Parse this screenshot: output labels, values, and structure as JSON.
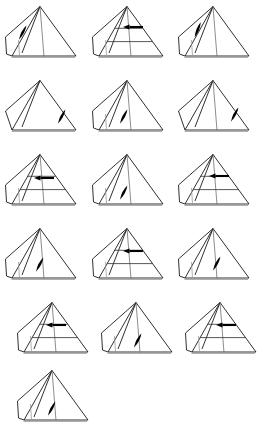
{
  "page": {
    "background_color": "#ffffff",
    "width": 269,
    "height": 432,
    "line_color": "#1a1a1a",
    "faint_line_color": "#9a9a9a",
    "arrow_color": "#000000",
    "figure_count": 16,
    "columns": 3,
    "rows": 6
  },
  "figures": [
    {
      "id": "figure-1",
      "row": 1,
      "col": 1,
      "x": 4,
      "y": 4,
      "w": 80,
      "h": 64,
      "arrow_type": "diagonal",
      "arrow_direction": "down-left",
      "arrow_x": 19,
      "arrow_y": 28,
      "arrow_angle": 62,
      "arrow_length": 16,
      "cross_sections": 0,
      "ridge_lines": 2,
      "left_panel": true,
      "label": "pyramid-diagonal-arrow-upper-left"
    },
    {
      "id": "figure-2",
      "row": 1,
      "col": 2,
      "x": 91,
      "y": 4,
      "w": 80,
      "h": 64,
      "arrow_type": "horizontal",
      "arrow_direction": "left",
      "arrow_x": 52,
      "arrow_y": 23,
      "arrow_angle": 180,
      "arrow_length": 20,
      "cross_sections": 2,
      "ridge_lines": 2,
      "left_panel": true,
      "label": "pyramid-horizontal-arrow-with-sections"
    },
    {
      "id": "figure-3",
      "row": 1,
      "col": 3,
      "x": 177,
      "y": 4,
      "w": 80,
      "h": 64,
      "arrow_type": "diagonal",
      "arrow_direction": "down-left",
      "arrow_x": 21,
      "arrow_y": 25,
      "arrow_angle": 68,
      "arrow_length": 16,
      "cross_sections": 0,
      "ridge_lines": 2,
      "left_panel": true,
      "label": "pyramid-diagonal-arrow-upper-left"
    },
    {
      "id": "figure-4",
      "row": 2,
      "col": 1,
      "x": 4,
      "y": 78,
      "w": 80,
      "h": 64,
      "arrow_type": "diagonal",
      "arrow_direction": "down-left",
      "arrow_x": 58,
      "arrow_y": 38,
      "arrow_angle": 62,
      "arrow_length": 16,
      "cross_sections": 0,
      "ridge_lines": 1,
      "left_panel": false,
      "label": "pyramid-diagonal-arrow-right-face"
    },
    {
      "id": "figure-5",
      "row": 2,
      "col": 2,
      "x": 91,
      "y": 78,
      "w": 80,
      "h": 64,
      "arrow_type": "diagonal",
      "arrow_direction": "down-left",
      "arrow_x": 33,
      "arrow_y": 38,
      "arrow_angle": 62,
      "arrow_length": 16,
      "cross_sections": 0,
      "ridge_lines": 2,
      "left_panel": true,
      "label": "pyramid-diagonal-arrow-center"
    },
    {
      "id": "figure-6",
      "row": 2,
      "col": 3,
      "x": 177,
      "y": 78,
      "w": 80,
      "h": 64,
      "arrow_type": "diagonal",
      "arrow_direction": "down-left",
      "arrow_x": 58,
      "arrow_y": 36,
      "arrow_angle": 62,
      "arrow_length": 16,
      "cross_sections": 0,
      "ridge_lines": 2,
      "left_panel": false,
      "label": "pyramid-diagonal-arrow-right-face"
    },
    {
      "id": "figure-7",
      "row": 3,
      "col": 1,
      "x": 4,
      "y": 152,
      "w": 80,
      "h": 64,
      "arrow_type": "horizontal",
      "arrow_direction": "left",
      "arrow_x": 50,
      "arrow_y": 26,
      "arrow_angle": 180,
      "arrow_length": 20,
      "cross_sections": 2,
      "ridge_lines": 2,
      "left_panel": true,
      "label": "pyramid-horizontal-arrow-with-sections"
    },
    {
      "id": "figure-8",
      "row": 3,
      "col": 2,
      "x": 91,
      "y": 152,
      "w": 80,
      "h": 64,
      "arrow_type": "diagonal",
      "arrow_direction": "down-left",
      "arrow_x": 33,
      "arrow_y": 40,
      "arrow_angle": 62,
      "arrow_length": 16,
      "cross_sections": 0,
      "ridge_lines": 2,
      "left_panel": true,
      "label": "pyramid-diagonal-arrow-center"
    },
    {
      "id": "figure-9",
      "row": 3,
      "col": 3,
      "x": 177,
      "y": 152,
      "w": 80,
      "h": 64,
      "arrow_type": "horizontal",
      "arrow_direction": "left",
      "arrow_x": 52,
      "arrow_y": 24,
      "arrow_angle": 180,
      "arrow_length": 20,
      "cross_sections": 2,
      "ridge_lines": 2,
      "left_panel": true,
      "label": "pyramid-horizontal-arrow-with-sections"
    },
    {
      "id": "figure-10",
      "row": 4,
      "col": 1,
      "x": 4,
      "y": 226,
      "w": 80,
      "h": 64,
      "arrow_type": "diagonal",
      "arrow_direction": "down-left",
      "arrow_x": 36,
      "arrow_y": 38,
      "arrow_angle": 62,
      "arrow_length": 16,
      "cross_sections": 0,
      "ridge_lines": 2,
      "left_panel": true,
      "label": "pyramid-diagonal-arrow-center"
    },
    {
      "id": "figure-11",
      "row": 4,
      "col": 2,
      "x": 91,
      "y": 226,
      "w": 80,
      "h": 64,
      "arrow_type": "horizontal",
      "arrow_direction": "left",
      "arrow_x": 52,
      "arrow_y": 25,
      "arrow_angle": 180,
      "arrow_length": 20,
      "cross_sections": 2,
      "ridge_lines": 2,
      "left_panel": true,
      "label": "pyramid-horizontal-arrow-with-sections"
    },
    {
      "id": "figure-12",
      "row": 4,
      "col": 3,
      "x": 177,
      "y": 226,
      "w": 80,
      "h": 64,
      "arrow_type": "diagonal",
      "arrow_direction": "down-left",
      "arrow_x": 40,
      "arrow_y": 37,
      "arrow_angle": 62,
      "arrow_length": 16,
      "cross_sections": 0,
      "ridge_lines": 2,
      "left_panel": true,
      "label": "pyramid-diagonal-arrow-center"
    },
    {
      "id": "figure-13",
      "row": 5,
      "col": 1,
      "x": 16,
      "y": 300,
      "w": 80,
      "h": 64,
      "arrow_type": "horizontal",
      "arrow_direction": "left",
      "arrow_x": 50,
      "arrow_y": 25,
      "arrow_angle": 180,
      "arrow_length": 20,
      "cross_sections": 2,
      "ridge_lines": 2,
      "left_panel": true,
      "label": "pyramid-horizontal-arrow-with-sections"
    },
    {
      "id": "figure-14",
      "row": 5,
      "col": 2,
      "x": 100,
      "y": 300,
      "w": 80,
      "h": 64,
      "arrow_type": "diagonal",
      "arrow_direction": "down-left",
      "arrow_x": 38,
      "arrow_y": 40,
      "arrow_angle": 62,
      "arrow_length": 16,
      "cross_sections": 0,
      "ridge_lines": 2,
      "left_panel": true,
      "label": "pyramid-diagonal-arrow-center"
    },
    {
      "id": "figure-15",
      "row": 5,
      "col": 3,
      "x": 184,
      "y": 300,
      "w": 80,
      "h": 64,
      "arrow_type": "horizontal",
      "arrow_direction": "left",
      "arrow_x": 52,
      "arrow_y": 25,
      "arrow_angle": 180,
      "arrow_length": 20,
      "cross_sections": 2,
      "ridge_lines": 2,
      "left_panel": true,
      "label": "pyramid-horizontal-arrow-with-sections"
    },
    {
      "id": "figure-16",
      "row": 6,
      "col": 1,
      "x": 16,
      "y": 368,
      "w": 80,
      "h": 64,
      "arrow_type": "diagonal",
      "arrow_direction": "down-left",
      "arrow_x": 36,
      "arrow_y": 40,
      "arrow_angle": 62,
      "arrow_length": 16,
      "cross_sections": 0,
      "ridge_lines": 2,
      "left_panel": true,
      "label": "pyramid-diagonal-arrow-center"
    }
  ]
}
